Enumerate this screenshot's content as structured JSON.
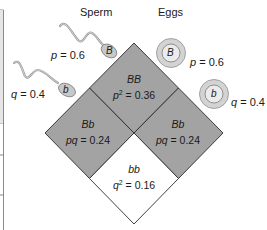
{
  "headers": {
    "sperm": "Sperm",
    "eggs": "Eggs"
  },
  "sperm": [
    {
      "allele": "B",
      "freq_var": "p",
      "freq_value": "0.6"
    },
    {
      "allele": "b",
      "freq_var": "q",
      "freq_value": "0.4"
    }
  ],
  "eggs": [
    {
      "allele": "B",
      "freq_var": "p",
      "freq_value": "0.6"
    },
    {
      "allele": "b",
      "freq_var": "q",
      "freq_value": "0.4"
    }
  ],
  "cells": {
    "BB": {
      "genotype": "BB",
      "expr": "p",
      "sup": "2",
      "value": "0.36"
    },
    "Bb_left": {
      "genotype": "Bb",
      "expr": "pq",
      "value": "0.24"
    },
    "Bb_right": {
      "genotype": "Bb",
      "expr": "pq",
      "value": "0.24"
    },
    "bb": {
      "genotype": "bb",
      "expr": "q",
      "sup": "2",
      "value": "0.16"
    }
  },
  "colors": {
    "shaded": "#a3a3a3",
    "unshaded": "#ffffff",
    "outline": "#2b2b2b",
    "egg_outer": "#c9c9c9",
    "frame": "#8a8a8a"
  }
}
